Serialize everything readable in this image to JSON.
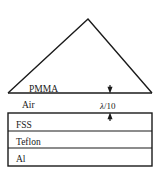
{
  "figure": {
    "type": "cross-section-layer-diagram",
    "background_color": "#ffffff",
    "line_color": "#1a1a1a",
    "prism": {
      "label": "PMMA",
      "shape": "triangle",
      "apex": {
        "x": 88,
        "y": 19
      },
      "base_left": {
        "x": 8,
        "y": 93
      },
      "base_right": {
        "x": 152,
        "y": 93
      }
    },
    "gap": {
      "label": "Air",
      "dimension_label_lambda": "λ",
      "dimension_label_divider": "/10",
      "dimension_label_full": "λ/10",
      "arrow_x": 110,
      "top_y": 93,
      "bottom_y": 113
    },
    "stack": {
      "left": 8,
      "right": 152,
      "top": 113,
      "bottom": 166,
      "layers": [
        {
          "name": "FSS",
          "top": 113,
          "bottom": 131
        },
        {
          "name": "Teflon",
          "top": 131,
          "bottom": 148
        },
        {
          "name": "Al",
          "top": 148,
          "bottom": 166
        }
      ]
    },
    "label_positions": {
      "pmma": {
        "x": 29,
        "y": 91
      },
      "air": {
        "x": 22,
        "y": 108
      },
      "gap": {
        "x": 100,
        "y": 108
      },
      "fss": {
        "x": 16,
        "y": 127
      },
      "teflon": {
        "x": 16,
        "y": 144
      },
      "al": {
        "x": 16,
        "y": 162
      }
    }
  }
}
